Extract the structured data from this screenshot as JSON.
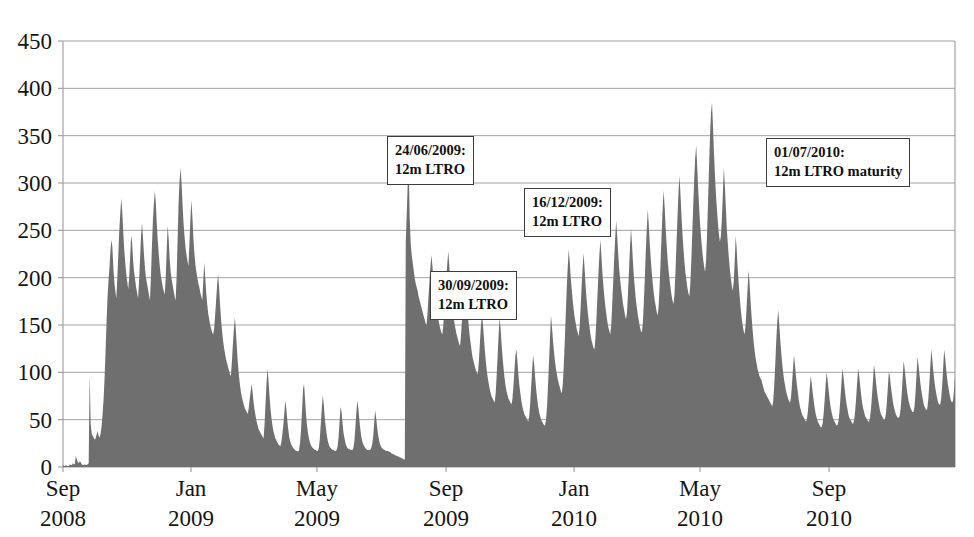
{
  "chart_data": {
    "type": "area",
    "title": "",
    "subtitle": "",
    "xlabel": "",
    "ylabel": "",
    "ylim": [
      0,
      450
    ],
    "ytick_step": 50,
    "grid": true,
    "legend": false,
    "legend_position": "none",
    "series_color": "#6f6f6f",
    "axis_color": "#9a9a9a",
    "yticks": [
      "0",
      "50",
      "100",
      "150",
      "200",
      "250",
      "300",
      "350",
      "400",
      "450"
    ],
    "ytick_values": [
      0,
      50,
      100,
      150,
      200,
      250,
      300,
      350,
      400,
      450
    ],
    "xticks": [
      {
        "month": "Sep",
        "year": "2008",
        "index": 0
      },
      {
        "month": "Jan",
        "year": "2009",
        "index": 122
      },
      {
        "month": "May",
        "year": "2009",
        "index": 242
      },
      {
        "month": "Sep",
        "year": "2009",
        "index": 365
      },
      {
        "month": "Jan",
        "year": "2010",
        "index": 487
      },
      {
        "month": "May",
        "year": "2010",
        "index": 607
      },
      {
        "month": "Sep",
        "year": "2010",
        "index": 730
      }
    ],
    "x_index_max": 850,
    "annotations": [
      {
        "line1": "24/06/2009:",
        "line2": "12m LTRO",
        "x_px": 387,
        "y_px": 136
      },
      {
        "line1": "30/09/2009:",
        "line2": "12m LTRO",
        "x_px": 430,
        "y_px": 271
      },
      {
        "line1": "16/12/2009:",
        "line2": "12m LTRO",
        "x_px": 524,
        "y_px": 188
      },
      {
        "line1": "01/07/2010:",
        "line2": "12m LTRO maturity",
        "x_px": 766,
        "y_px": 138
      }
    ],
    "values": [
      2,
      1,
      1,
      2,
      1,
      1,
      1,
      3,
      2,
      2,
      4,
      3,
      3,
      12,
      8,
      5,
      4,
      6,
      5,
      3,
      2,
      2,
      3,
      2,
      2,
      3,
      4,
      98,
      46,
      36,
      33,
      31,
      29,
      30,
      34,
      38,
      33,
      31,
      35,
      42,
      55,
      70,
      92,
      120,
      150,
      178,
      196,
      210,
      228,
      240,
      232,
      210,
      195,
      186,
      178,
      200,
      225,
      250,
      268,
      284,
      270,
      248,
      230,
      216,
      204,
      196,
      188,
      200,
      222,
      245,
      236,
      218,
      206,
      198,
      190,
      184,
      178,
      196,
      220,
      244,
      258,
      242,
      224,
      210,
      200,
      194,
      188,
      182,
      176,
      200,
      232,
      260,
      278,
      292,
      278,
      256,
      238,
      224,
      212,
      202,
      196,
      190,
      186,
      182,
      200,
      230,
      255,
      240,
      220,
      206,
      198,
      192,
      186,
      180,
      176,
      200,
      240,
      278,
      302,
      316,
      300,
      278,
      258,
      244,
      232,
      224,
      218,
      212,
      236,
      262,
      282,
      264,
      242,
      226,
      214,
      206,
      200,
      194,
      190,
      184,
      180,
      176,
      196,
      216,
      200,
      184,
      172,
      162,
      156,
      150,
      146,
      142,
      140,
      146,
      160,
      176,
      192,
      204,
      190,
      172,
      156,
      144,
      134,
      126,
      120,
      114,
      110,
      106,
      102,
      98,
      96,
      112,
      130,
      146,
      158,
      144,
      126,
      110,
      98,
      88,
      80,
      74,
      70,
      66,
      62,
      60,
      58,
      56,
      62,
      72,
      80,
      88,
      78,
      68,
      60,
      54,
      48,
      44,
      40,
      38,
      36,
      34,
      32,
      30,
      44,
      66,
      88,
      104,
      92,
      76,
      62,
      52,
      44,
      38,
      34,
      30,
      28,
      26,
      24,
      23,
      22,
      26,
      34,
      44,
      56,
      70,
      62,
      50,
      40,
      32,
      27,
      24,
      22,
      20,
      19,
      18,
      17,
      17,
      16,
      18,
      26,
      40,
      60,
      82,
      88,
      72,
      56,
      44,
      36,
      30,
      26,
      23,
      21,
      20,
      19,
      18,
      18,
      17,
      17,
      20,
      30,
      46,
      62,
      76,
      66,
      52,
      42,
      34,
      28,
      24,
      21,
      20,
      19,
      18,
      18,
      17,
      17,
      18,
      22,
      32,
      48,
      64,
      58,
      46,
      36,
      30,
      25,
      22,
      20,
      19,
      19,
      18,
      18,
      18,
      20,
      28,
      42,
      58,
      70,
      62,
      50,
      40,
      32,
      27,
      24,
      22,
      20,
      19,
      18,
      18,
      18,
      18,
      20,
      24,
      32,
      46,
      60,
      52,
      42,
      34,
      28,
      24,
      21,
      20,
      19,
      18,
      18,
      17,
      17,
      17,
      16,
      16,
      15,
      14,
      14,
      13,
      13,
      12,
      12,
      11,
      11,
      10,
      10,
      9,
      9,
      8,
      8,
      238,
      268,
      300,
      320,
      262,
      236,
      224,
      216,
      208,
      200,
      194,
      190,
      186,
      180,
      176,
      172,
      168,
      164,
      160,
      156,
      152,
      150,
      162,
      180,
      196,
      212,
      224,
      212,
      198,
      186,
      176,
      168,
      162,
      156,
      150,
      146,
      142,
      140,
      150,
      166,
      184,
      200,
      214,
      228,
      214,
      198,
      184,
      172,
      162,
      154,
      148,
      142,
      138,
      134,
      130,
      128,
      140,
      158,
      176,
      190,
      200,
      188,
      172,
      158,
      146,
      136,
      128,
      120,
      114,
      110,
      106,
      102,
      100,
      98,
      112,
      130,
      148,
      162,
      152,
      138,
      124,
      112,
      102,
      94,
      88,
      82,
      78,
      74,
      72,
      70,
      68,
      78,
      96,
      118,
      140,
      158,
      146,
      130,
      116,
      104,
      94,
      86,
      80,
      76,
      72,
      70,
      68,
      66,
      72,
      86,
      102,
      118,
      124,
      112,
      98,
      86,
      78,
      70,
      64,
      60,
      56,
      54,
      52,
      50,
      48,
      54,
      68,
      86,
      104,
      118,
      108,
      94,
      82,
      72,
      64,
      58,
      54,
      50,
      48,
      46,
      44,
      44,
      50,
      64,
      86,
      110,
      136,
      160,
      148,
      134,
      122,
      112,
      104,
      98,
      92,
      88,
      84,
      80,
      78,
      88,
      108,
      134,
      162,
      190,
      212,
      230,
      216,
      200,
      188,
      176,
      166,
      158,
      152,
      146,
      142,
      138,
      148,
      168,
      190,
      210,
      226,
      210,
      192,
      178,
      166,
      156,
      148,
      140,
      134,
      130,
      126,
      124,
      136,
      156,
      180,
      204,
      224,
      240,
      224,
      206,
      192,
      180,
      170,
      162,
      154,
      148,
      144,
      140,
      150,
      172,
      196,
      220,
      242,
      260,
      244,
      226,
      210,
      198,
      188,
      180,
      172,
      166,
      160,
      156,
      164,
      184,
      208,
      232,
      252,
      236,
      216,
      200,
      188,
      176,
      168,
      160,
      154,
      148,
      144,
      142,
      152,
      174,
      200,
      228,
      252,
      272,
      256,
      236,
      220,
      206,
      194,
      184,
      176,
      170,
      164,
      160,
      170,
      192,
      218,
      246,
      272,
      292,
      276,
      254,
      236,
      220,
      208,
      198,
      190,
      182,
      176,
      172,
      182,
      206,
      234,
      262,
      288,
      308,
      290,
      268,
      248,
      232,
      218,
      206,
      198,
      190,
      184,
      180,
      192,
      216,
      246,
      276,
      304,
      326,
      340,
      318,
      294,
      274,
      256,
      242,
      230,
      220,
      212,
      206,
      218,
      246,
      280,
      316,
      350,
      374,
      385,
      360,
      332,
      308,
      288,
      272,
      258,
      246,
      238,
      244,
      262,
      288,
      316,
      298,
      274,
      252,
      236,
      222,
      210,
      200,
      192,
      186,
      196,
      218,
      244,
      230,
      210,
      194,
      180,
      168,
      158,
      150,
      144,
      140,
      150,
      168,
      188,
      208,
      194,
      176,
      160,
      146,
      134,
      124,
      116,
      110,
      104,
      100,
      96,
      94,
      92,
      88,
      84,
      80,
      78,
      76,
      74,
      72,
      70,
      68,
      66,
      64,
      70,
      86,
      108,
      132,
      152,
      166,
      152,
      136,
      122,
      110,
      100,
      92,
      86,
      80,
      76,
      72,
      70,
      68,
      74,
      88,
      104,
      118,
      108,
      96,
      86,
      78,
      70,
      64,
      60,
      56,
      54,
      52,
      50,
      48,
      50,
      58,
      70,
      84,
      96,
      88,
      78,
      70,
      62,
      56,
      52,
      48,
      46,
      44,
      42,
      42,
      46,
      56,
      70,
      86,
      100,
      92,
      82,
      72,
      64,
      58,
      54,
      50,
      48,
      46,
      44,
      44,
      48,
      58,
      72,
      88,
      104,
      96,
      86,
      76,
      68,
      62,
      56,
      52,
      50,
      48,
      46,
      46,
      50,
      60,
      74,
      90,
      104,
      96,
      86,
      76,
      68,
      62,
      58,
      54,
      52,
      50,
      48,
      48,
      52,
      62,
      76,
      92,
      108,
      100,
      90,
      80,
      72,
      66,
      60,
      56,
      54,
      52,
      50,
      50,
      56,
      68,
      84,
      100,
      96,
      86,
      78,
      70,
      64,
      60,
      56,
      54,
      52,
      52,
      54,
      62,
      76,
      94,
      112,
      104,
      94,
      84,
      76,
      70,
      66,
      62,
      60,
      58,
      58,
      64,
      78,
      96,
      116,
      108,
      98,
      88,
      80,
      74,
      68,
      64,
      62,
      60,
      62,
      72,
      88,
      106,
      124,
      114,
      102,
      92,
      84,
      78,
      72,
      68,
      66,
      66,
      72,
      86,
      104,
      124,
      116,
      104,
      94,
      86,
      80,
      74,
      70,
      68,
      70,
      80,
      96
    ],
    "gap": {
      "start_index": 330,
      "end_index": 346,
      "note": "series drops to near zero before 24/06/2009 LTRO"
    }
  }
}
